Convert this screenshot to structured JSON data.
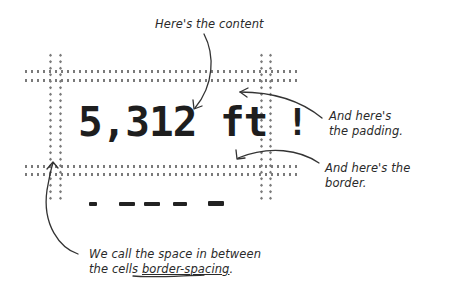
{
  "diagram": {
    "cells": [
      {
        "content": "5,312 ft",
        "role": "content"
      },
      {
        "content": "!",
        "role": "content"
      }
    ],
    "second_row_dashes": [
      "-",
      "—",
      "—",
      "—",
      "—"
    ],
    "annotations": {
      "content": "Here's the content",
      "padding_line1": "And here's",
      "padding_line2": "the padding.",
      "border": "And here's the border.",
      "spacing_line1": "We call the space in between",
      "spacing_line2_prefix": "the cells ",
      "spacing_term": "border-spacing",
      "spacing_line2_suffix": "."
    },
    "colors": {
      "border_dots": "#7a7a7a",
      "text": "#1e1e1e",
      "annotation": "#2a2a2a",
      "background": "#ffffff"
    }
  }
}
